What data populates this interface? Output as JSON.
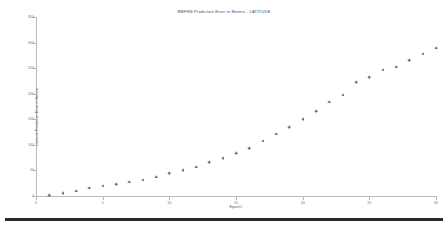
{
  "chart_data": {
    "type": "scatter",
    "title": "RBFNN Prediction Error in Meters - LATITUDE",
    "xlabel": "Epoch#",
    "ylabel": "Latitude Prediction Error in Meters",
    "xlim": [
      0,
      30
    ],
    "ylim": [
      0,
      350
    ],
    "xticks": [
      0,
      5,
      10,
      15,
      20,
      25,
      30
    ],
    "yticks": [
      0,
      50,
      100,
      150,
      200,
      250,
      300,
      350
    ],
    "grid": false,
    "legend": null,
    "marker": "plus",
    "marker_color": "#55555f",
    "x": [
      1,
      2,
      3,
      4,
      5,
      6,
      7,
      8,
      9,
      10,
      11,
      12,
      13,
      14,
      15,
      16,
      17,
      18,
      19,
      20,
      21,
      22,
      23,
      24,
      25,
      26,
      27,
      28,
      29,
      30
    ],
    "y": [
      2,
      6,
      10,
      16,
      20,
      23,
      28,
      32,
      38,
      45,
      50,
      57,
      66,
      74,
      84,
      94,
      108,
      122,
      135,
      150,
      166,
      184,
      198,
      222,
      232,
      247,
      253,
      265,
      278,
      290
    ],
    "series": [
      {
        "name": "Latitude Prediction Error",
        "x": [
          1,
          2,
          3,
          4,
          5,
          6,
          7,
          8,
          9,
          10,
          11,
          12,
          13,
          14,
          15,
          16,
          17,
          18,
          19,
          20,
          21,
          22,
          23,
          24,
          25,
          26,
          27,
          28,
          29,
          30
        ],
        "values": [
          2,
          6,
          10,
          16,
          20,
          23,
          28,
          32,
          38,
          45,
          50,
          57,
          66,
          74,
          84,
          94,
          108,
          122,
          135,
          150,
          166,
          184,
          198,
          222,
          232,
          247,
          253,
          265,
          278,
          290
        ]
      }
    ]
  },
  "figure": {
    "background_color": "#ffffff",
    "axis_color": "#b9b9c2",
    "text_color": "#5a5a66",
    "bottom_bar_color": "#2b2b2b"
  }
}
